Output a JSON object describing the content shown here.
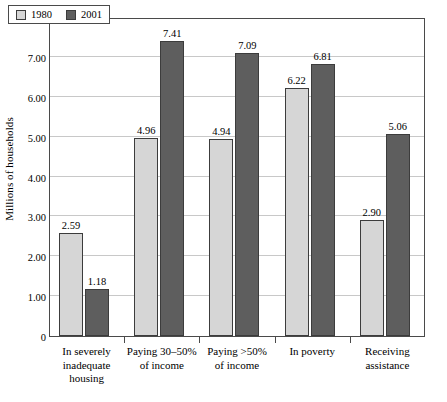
{
  "chart_data": {
    "type": "bar",
    "title": "",
    "xlabel": "",
    "ylabel": "Millions of households",
    "ylim": [
      0,
      8
    ],
    "ytick_step": 1,
    "grid": true,
    "legend_position": "top-left-inside",
    "categories": [
      [
        "In severely",
        "inadequate",
        "housing"
      ],
      [
        "Paying 30–50%",
        "of income"
      ],
      [
        "Paying >50%",
        "of income"
      ],
      [
        "In poverty"
      ],
      [
        "Receiving",
        "assistance"
      ]
    ],
    "series": [
      {
        "name": "1980",
        "color": "#D6D6D6",
        "values": [
          2.59,
          4.96,
          4.94,
          6.22,
          2.9
        ]
      },
      {
        "name": "2001",
        "color": "#5E5E5E",
        "values": [
          1.18,
          7.41,
          7.09,
          6.81,
          5.06
        ]
      }
    ],
    "value_labels": [
      [
        "2.59",
        "4.96",
        "4.94",
        "6.22",
        "2.90"
      ],
      [
        "1.18",
        "7.41",
        "7.09",
        "6.81",
        "5.06"
      ]
    ],
    "ytick_labels": [
      "0",
      "1.00",
      "2.00",
      "3.00",
      "4.00",
      "5.00",
      "6.00",
      "7.00",
      "8.00"
    ],
    "ytick_values": [
      0,
      1,
      2,
      3,
      4,
      5,
      6,
      7,
      8
    ]
  },
  "legend": {
    "entries": [
      {
        "label": "1980",
        "color": "#D6D6D6"
      },
      {
        "label": "2001",
        "color": "#5E5E5E"
      }
    ]
  },
  "axes": {
    "y_title": "Millions of households"
  }
}
